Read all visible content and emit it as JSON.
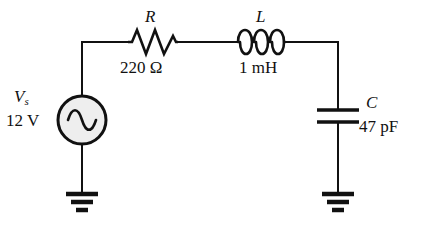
{
  "figure": {
    "name": "rlc-series-circuit-schematic",
    "background_color": "#ffffff",
    "line_color": "#111111",
    "source_fill_color": "#eeeeee"
  },
  "components": {
    "source": {
      "type": "ac-voltage-source",
      "symbol": "V",
      "subscript": "s",
      "value": "12 V",
      "icon": "sine-wave-icon"
    },
    "resistor": {
      "type": "resistor",
      "symbol": "R",
      "value": "220 Ω",
      "icon": "resistor-zigzag-icon"
    },
    "inductor": {
      "type": "inductor",
      "symbol": "L",
      "value": "1 mH",
      "icon": "inductor-coil-icon"
    },
    "capacitor": {
      "type": "capacitor",
      "symbol": "C",
      "value": "47 pF",
      "icon": "capacitor-plates-icon"
    },
    "ground_left": {
      "type": "ground",
      "icon": "ground-icon"
    },
    "ground_right": {
      "type": "ground",
      "icon": "ground-icon"
    }
  }
}
